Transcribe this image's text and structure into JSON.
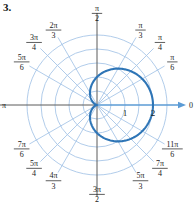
{
  "problem": {
    "number": "3."
  },
  "figure": {
    "name": "polar-graph",
    "center": {
      "x": 97,
      "y": 105
    },
    "pixels_per_unit": 28,
    "colors": {
      "grid": "#a8c6e8",
      "axis": "#5a5a5a",
      "polar_axis": "#5b9bd5",
      "curve": "#2e75b6",
      "text": "#1a1a1a"
    },
    "grid": {
      "circle_radii": [
        0.5,
        1,
        1.5,
        2,
        2.5
      ],
      "ray_count": 12,
      "ray_step_deg": 30
    },
    "radial_ticks": [
      {
        "label": "1",
        "value": 1
      },
      {
        "label": "2",
        "value": 2
      }
    ],
    "angle_labels": [
      {
        "numerator": "",
        "denominator": "",
        "whole": "0",
        "angle_deg": 0
      },
      {
        "numerator": "π",
        "denominator": "6",
        "whole": "",
        "angle_deg": 30
      },
      {
        "numerator": "π",
        "denominator": "4",
        "whole": "",
        "angle_deg": 45
      },
      {
        "numerator": "π",
        "denominator": "3",
        "whole": "",
        "angle_deg": 60
      },
      {
        "numerator": "π",
        "denominator": "2",
        "whole": "",
        "angle_deg": 90
      },
      {
        "numerator": "2π",
        "denominator": "3",
        "whole": "",
        "angle_deg": 120
      },
      {
        "numerator": "3π",
        "denominator": "4",
        "whole": "",
        "angle_deg": 135
      },
      {
        "numerator": "5π",
        "denominator": "6",
        "whole": "",
        "angle_deg": 150
      },
      {
        "numerator": "",
        "denominator": "",
        "whole": "π",
        "angle_deg": 180
      },
      {
        "numerator": "7π",
        "denominator": "6",
        "whole": "",
        "angle_deg": 210
      },
      {
        "numerator": "5π",
        "denominator": "4",
        "whole": "",
        "angle_deg": 225
      },
      {
        "numerator": "4π",
        "denominator": "3",
        "whole": "",
        "angle_deg": 240
      },
      {
        "numerator": "3π",
        "denominator": "2",
        "whole": "",
        "angle_deg": 270
      },
      {
        "numerator": "5π",
        "denominator": "3",
        "whole": "",
        "angle_deg": 300
      },
      {
        "numerator": "7π",
        "denominator": "4",
        "whole": "",
        "angle_deg": 315
      },
      {
        "numerator": "11π",
        "denominator": "6",
        "whole": "",
        "angle_deg": 330
      }
    ]
  },
  "chart_data": {
    "type": "line",
    "title": "",
    "xlabel": "",
    "ylabel": "",
    "coordinate_system": "polar",
    "curve_name": "cardioid",
    "equation": "r = 1 + cos θ",
    "r_max": 2,
    "r_min": 0,
    "theta_range_deg": [
      0,
      360
    ],
    "theta_tick_labels": [
      "0",
      "π/6",
      "π/4",
      "π/3",
      "π/2",
      "2π/3",
      "3π/4",
      "5π/6",
      "π",
      "7π/6",
      "5π/4",
      "4π/3",
      "3π/2",
      "5π/3",
      "7π/4",
      "11π/6"
    ],
    "r_tick_labels": [
      "1",
      "2"
    ],
    "grid": true,
    "legend": "none",
    "series": [
      {
        "name": "r = 1 + cos θ",
        "theta_deg": [
          0,
          15,
          30,
          45,
          60,
          75,
          90,
          105,
          120,
          135,
          150,
          165,
          180,
          195,
          210,
          225,
          240,
          255,
          270,
          285,
          300,
          315,
          330,
          345,
          360
        ],
        "r": [
          2.0,
          1.966,
          1.866,
          1.707,
          1.5,
          1.259,
          1.0,
          0.741,
          0.5,
          0.293,
          0.134,
          0.034,
          0.0,
          0.034,
          0.134,
          0.293,
          0.5,
          0.741,
          1.0,
          1.259,
          1.5,
          1.707,
          1.866,
          1.966,
          2.0
        ]
      }
    ]
  }
}
